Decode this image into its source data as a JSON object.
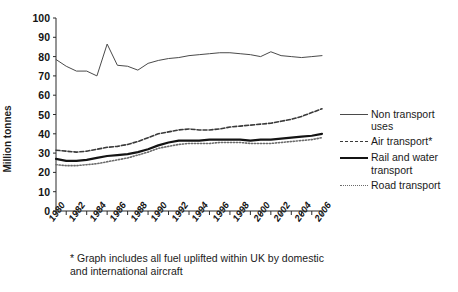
{
  "chart_data": {
    "type": "line",
    "title": "",
    "xlabel": "",
    "ylabel": "Million tonnes",
    "ylim": [
      0,
      100
    ],
    "ytick_step": 10,
    "ytick_labels": [
      "0",
      "10",
      "20",
      "30",
      "40",
      "50",
      "60",
      "70",
      "80",
      "90",
      "100"
    ],
    "xlim": [
      1980,
      2006
    ],
    "x": [
      1980,
      1981,
      1982,
      1983,
      1984,
      1985,
      1986,
      1987,
      1988,
      1989,
      1990,
      1991,
      1992,
      1993,
      1994,
      1995,
      1996,
      1997,
      1998,
      1999,
      2000,
      2001,
      2002,
      2003,
      2004,
      2005,
      2006
    ],
    "xtick_labels": [
      "1980",
      "1982",
      "1984",
      "1986",
      "1988",
      "1990",
      "1992",
      "1994",
      "1996",
      "1998",
      "2000",
      "2002",
      "2004",
      "2006"
    ],
    "grid": false,
    "legend_position": "right",
    "series": [
      {
        "name": "Non transport uses",
        "style": "thin-solid",
        "color": "#4a4a4a",
        "values": [
          78.5,
          75.0,
          72.5,
          72.5,
          70.0,
          86.5,
          75.5,
          75.0,
          73.0,
          76.5,
          78.0,
          79.0,
          79.5,
          80.5,
          81.0,
          81.5,
          82.0,
          82.0,
          81.5,
          81.0,
          80.0,
          82.5,
          80.5,
          80.0,
          79.5,
          80.0,
          80.5
        ]
      },
      {
        "name": "Air transport*",
        "style": "dashed",
        "color": "#3a3a3a",
        "values": [
          31.5,
          31.0,
          30.5,
          31.0,
          32.0,
          33.0,
          33.5,
          34.5,
          36.0,
          38.0,
          40.0,
          41.0,
          42.0,
          42.5,
          42.0,
          42.0,
          42.5,
          43.5,
          44.0,
          44.5,
          45.0,
          45.5,
          46.5,
          47.5,
          49.0,
          51.0,
          53.0
        ]
      },
      {
        "name": "Rail and water transport",
        "style": "thick-solid",
        "color": "#141414",
        "values": [
          27.0,
          26.0,
          26.0,
          26.5,
          27.5,
          28.5,
          29.0,
          29.5,
          30.5,
          32.0,
          34.0,
          35.5,
          36.5,
          36.5,
          36.5,
          37.0,
          37.0,
          37.0,
          37.0,
          36.5,
          37.0,
          37.0,
          37.5,
          38.0,
          38.5,
          39.0,
          40.0
        ]
      },
      {
        "name": "Road transport",
        "style": "dotted",
        "color": "#6b6b6b",
        "values": [
          24.0,
          23.5,
          23.5,
          24.0,
          24.5,
          25.5,
          26.5,
          27.5,
          29.0,
          30.5,
          32.5,
          33.5,
          34.5,
          35.0,
          35.0,
          35.0,
          35.5,
          35.5,
          35.5,
          35.0,
          35.0,
          35.0,
          35.5,
          36.0,
          36.5,
          37.0,
          38.0
        ]
      }
    ]
  },
  "legend": {
    "items": [
      {
        "label": "Non transport",
        "label2": "uses",
        "swatch": "sw-thin"
      },
      {
        "label": "Air transport*",
        "label2": "",
        "swatch": "sw-dash"
      },
      {
        "label": "Rail and water",
        "label2": "transport",
        "swatch": "sw-thick"
      },
      {
        "label": "Road transport",
        "label2": "",
        "swatch": "sw-dot"
      }
    ]
  },
  "footnote": {
    "line1": "* Graph includes all fuel uplifted within UK by domestic",
    "line2": "and international aircraft"
  }
}
